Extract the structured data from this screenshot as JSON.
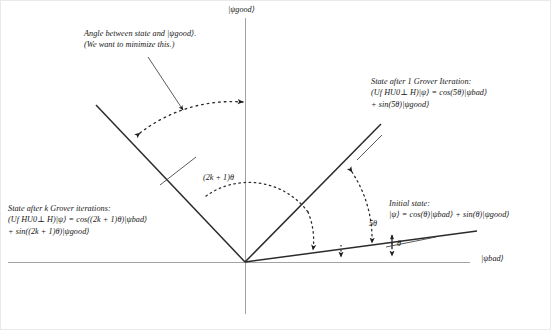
{
  "figure": {
    "type": "diagram",
    "axes": {
      "vertical_label": "|ψgood⟩",
      "horizontal_label": "|ψbad⟩",
      "origin": [
        245,
        262
      ]
    },
    "annotations": {
      "minimize_note": {
        "line1": "Angle between state and |ψgood⟩.",
        "line2": "(We want to minimize this.)"
      },
      "state_after_1": {
        "line1": "State after 1 Grover Iteration:",
        "line2": "(Uf HU0⊥ H)|ψ⟩ = cos(5θ)|ψbad⟩",
        "line3": "+ sin(5θ)|ψgood⟩"
      },
      "state_after_k": {
        "line1": "State after k Grover iterations:",
        "line2": "(Uf HU0⊥ H)|ψ⟩ = cos((2k + 1)θ)|ψbad⟩",
        "line3": "+ sin((2k + 1)θ)|ψgood⟩"
      },
      "initial_state": {
        "line1": "Initial state:",
        "line2": "|ψ⟩ = cos(θ)|ψbad⟩ + sin(θ)|ψgood⟩"
      }
    },
    "angle_labels": {
      "k_angle": "(2k + 1)θ",
      "five_theta": "5θ",
      "theta": "θ"
    },
    "colors": {
      "ray": "#2b2b2b",
      "axis": "#9a9a9a",
      "dotted": "#3a3a3a",
      "text": "#161616",
      "frame": "#e9e9e9"
    }
  }
}
